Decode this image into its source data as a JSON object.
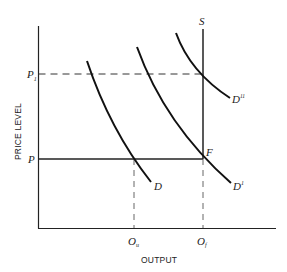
{
  "diagram": {
    "type": "aggregate supply and demand diagram",
    "axes": {
      "x_label": "OUTPUT",
      "y_label": "PRICE LEVEL"
    },
    "price_levels": [
      {
        "id": "P1",
        "label": "P",
        "subscript": "1",
        "style": "dashed"
      },
      {
        "id": "P",
        "label": "P",
        "subscript": "",
        "style": "solid"
      }
    ],
    "output_levels": [
      {
        "id": "Ou",
        "label": "O",
        "subscript": "u"
      },
      {
        "id": "Of",
        "label": "O",
        "subscript": "f"
      }
    ],
    "supply_curve": {
      "label": "S",
      "shape": "vertical at full-employment output"
    },
    "demand_curves": [
      {
        "id": "D",
        "label": "D",
        "superscript": ""
      },
      {
        "id": "D1",
        "label": "D",
        "superscript": "1"
      },
      {
        "id": "D2",
        "label": "D",
        "superscript": "11"
      }
    ],
    "points": [
      {
        "label": "F",
        "description": "intersection of S, D1 and price level P"
      }
    ],
    "colors": {
      "line": "#111111",
      "background": "#ffffff"
    }
  }
}
